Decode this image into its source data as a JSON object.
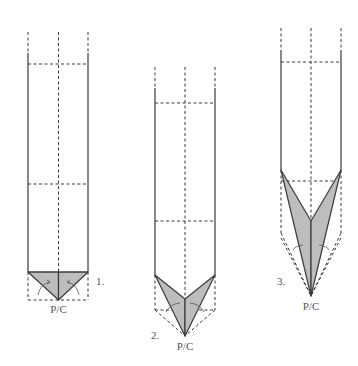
{
  "diagram": {
    "type": "origami-folding-steps",
    "colors": {
      "line": "#3a3a3a",
      "flap_fill": "#bdbdbd",
      "label": "#555555",
      "background": "#ffffff"
    },
    "steps": [
      {
        "number": "1.",
        "point_label": "P/C",
        "description": "Valley fold bottom corners to center forming a small triangle"
      },
      {
        "number": "2.",
        "point_label": "P/C",
        "description": "Fold sides in to center forming a V-shaped point"
      },
      {
        "number": "3.",
        "point_label": "P/C",
        "description": "Fold sides in further to form a long narrow point"
      }
    ]
  }
}
